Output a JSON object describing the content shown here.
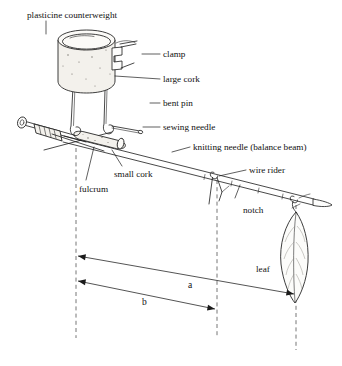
{
  "figure": {
    "background_color": "#ffffff",
    "ink_color": "#1b1b1b"
  },
  "labels": {
    "counterweight": "plasticine counterweight",
    "clamp": "clamp",
    "large_cork": "large cork",
    "bent_pin": "bent pin",
    "sewing_needle": "sewing needle",
    "knitting_needle": "knitting needle (balance beam)",
    "small_cork": "small cork",
    "fulcrum": "fulcrum",
    "wire_rider": "wire rider",
    "notch": "notch",
    "leaf": "leaf"
  },
  "dimensions": {
    "a": "a",
    "b": "b"
  },
  "parts": [
    {
      "name": "plasticine-counterweight",
      "label": "plasticine counterweight"
    },
    {
      "name": "clamp",
      "label": "clamp"
    },
    {
      "name": "large-cork",
      "label": "large cork"
    },
    {
      "name": "bent-pin",
      "label": "bent pin"
    },
    {
      "name": "sewing-needle",
      "label": "sewing needle"
    },
    {
      "name": "knitting-needle",
      "label": "knitting needle (balance beam)"
    },
    {
      "name": "small-cork",
      "label": "small cork"
    },
    {
      "name": "fulcrum",
      "label": "fulcrum"
    },
    {
      "name": "wire-rider",
      "label": "wire rider"
    },
    {
      "name": "notch",
      "label": "notch"
    },
    {
      "name": "leaf",
      "label": "leaf"
    }
  ]
}
